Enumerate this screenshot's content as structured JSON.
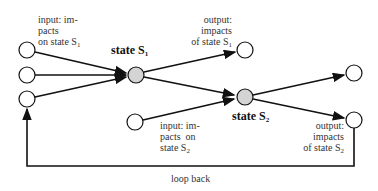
{
  "diagram": {
    "states": [
      {
        "id": "s1",
        "label": "state S",
        "sub": "1"
      },
      {
        "id": "s2",
        "label": "state S",
        "sub": "2"
      }
    ],
    "labels": {
      "input_s1": {
        "l1": "input: im-",
        "l2": "pacts",
        "l3": "on state S",
        "sub": "1"
      },
      "output_s1": {
        "l1": "output:",
        "l2": "impacts",
        "l3": "of state S",
        "sub": "1"
      },
      "input_s2": {
        "l1": "input: im-",
        "l2": "pacts  on",
        "l3": "state S",
        "sub": "2"
      },
      "output_s2": {
        "l1": "output:",
        "l2": "impacts",
        "l3": "of state S",
        "sub": "2"
      },
      "loop": "loop back"
    },
    "colors": {
      "state_fill": "#d4d4d4",
      "node_fill": "#ffffff",
      "stroke": "#111111"
    }
  }
}
